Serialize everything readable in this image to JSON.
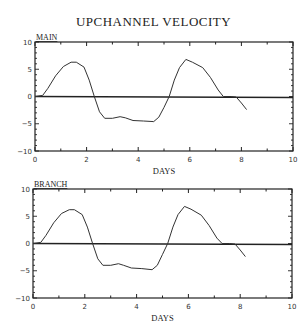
{
  "chart_data": [
    {
      "type": "line",
      "title": "UPCHANNEL VELOCITY",
      "panel_label": "MAIN",
      "xlabel": "DAYS",
      "ylabel": "",
      "xlim": [
        0,
        10
      ],
      "ylim": [
        -10,
        10
      ],
      "xticks": [
        0,
        2,
        4,
        6,
        8,
        10
      ],
      "yticks": [
        -10,
        -5,
        0,
        5,
        10
      ],
      "grid": false,
      "zero_line": true,
      "series": [
        {
          "name": "MAIN",
          "x": [
            0.0,
            0.3,
            0.5,
            0.8,
            1.1,
            1.4,
            1.6,
            1.9,
            2.1,
            2.3,
            2.5,
            2.7,
            3.0,
            3.3,
            3.5,
            3.8,
            4.2,
            4.6,
            4.8,
            5.0,
            5.2,
            5.4,
            5.6,
            5.85,
            6.1,
            6.5,
            6.8,
            7.1,
            7.3,
            7.6,
            7.8,
            8.0,
            8.2
          ],
          "y": [
            0.0,
            0.2,
            1.5,
            3.8,
            5.5,
            6.3,
            6.3,
            5.4,
            3.0,
            0.0,
            -2.8,
            -4.0,
            -4.0,
            -3.7,
            -3.9,
            -4.4,
            -4.5,
            -4.6,
            -3.8,
            -2.0,
            0.0,
            3.0,
            5.3,
            6.8,
            6.3,
            5.3,
            3.5,
            1.2,
            0.0,
            0.0,
            -0.1,
            -1.2,
            -2.4
          ]
        }
      ]
    },
    {
      "type": "line",
      "title": "UPCHANNEL VELOCITY",
      "panel_label": "BRANCH",
      "xlabel": "DAYS",
      "ylabel": "",
      "xlim": [
        0,
        10
      ],
      "ylim": [
        -10,
        10
      ],
      "xticks": [
        0,
        2,
        4,
        6,
        8,
        10
      ],
      "yticks": [
        -10,
        -5,
        0,
        5,
        10
      ],
      "grid": false,
      "zero_line": true,
      "series": [
        {
          "name": "BRANCH",
          "x": [
            0.0,
            0.3,
            0.5,
            0.8,
            1.1,
            1.4,
            1.6,
            1.9,
            2.1,
            2.3,
            2.5,
            2.7,
            3.0,
            3.3,
            3.5,
            3.8,
            4.2,
            4.6,
            4.8,
            5.0,
            5.2,
            5.4,
            5.6,
            5.85,
            6.1,
            6.5,
            6.8,
            7.1,
            7.3,
            7.6,
            7.8,
            8.0,
            8.2
          ],
          "y": [
            0.0,
            0.2,
            1.5,
            3.8,
            5.5,
            6.2,
            6.2,
            5.3,
            3.0,
            0.0,
            -2.8,
            -4.0,
            -4.0,
            -3.7,
            -4.0,
            -4.5,
            -4.6,
            -4.8,
            -4.0,
            -2.0,
            0.0,
            3.0,
            5.3,
            6.8,
            6.3,
            5.2,
            3.3,
            1.0,
            0.0,
            0.0,
            -0.1,
            -1.2,
            -2.4
          ]
        }
      ]
    }
  ],
  "title": "UPCHANNEL VELOCITY",
  "panels": [
    {
      "label": "MAIN",
      "xlabel": "DAYS"
    },
    {
      "label": "BRANCH",
      "xlabel": "DAYS"
    }
  ]
}
